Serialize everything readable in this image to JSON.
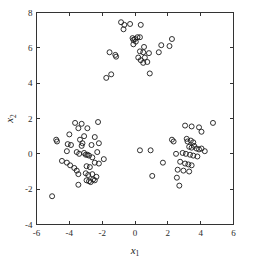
{
  "chart_data": {
    "type": "scatter",
    "title": "",
    "subtitle": "",
    "xlabel": "x_1",
    "xlabel_base": "x",
    "xlabel_sub": "1",
    "ylabel": "x_2",
    "ylabel_base": "x",
    "ylabel_sub": "2",
    "xlim": [
      -6,
      6
    ],
    "ylim": [
      -4,
      8
    ],
    "xticks": [
      -6,
      -4,
      -2,
      0,
      2,
      4,
      6
    ],
    "xtick_labels": [
      "-6",
      "-4",
      "-2",
      "0",
      "2",
      "4",
      "6"
    ],
    "yticks": [
      -4,
      -2,
      0,
      2,
      4,
      6,
      8
    ],
    "ytick_labels": [
      "-4",
      "-2",
      "0",
      "2",
      "4",
      "6",
      "8"
    ],
    "grid": false,
    "legend": null,
    "legend_position": "none",
    "marker": "open-circle",
    "marker_size": 5,
    "marker_color": "#1a1a1a",
    "series": [
      {
        "name": "cluster-top",
        "points": [
          [
            -0.85,
            7.45
          ],
          [
            -0.65,
            7.3
          ],
          [
            -0.7,
            7.05
          ],
          [
            -0.3,
            7.35
          ],
          [
            0.35,
            7.3
          ],
          [
            -0.15,
            6.55
          ],
          [
            -0.1,
            6.45
          ],
          [
            0.0,
            6.5
          ],
          [
            0.05,
            6.35
          ],
          [
            -0.1,
            6.2
          ],
          [
            0.15,
            6.6
          ],
          [
            0.3,
            6.6
          ],
          [
            0.55,
            6.05
          ],
          [
            2.25,
            6.5
          ],
          [
            1.6,
            6.15
          ],
          [
            -1.55,
            5.75
          ],
          [
            -1.2,
            5.6
          ],
          [
            -1.15,
            5.5
          ],
          [
            0.3,
            5.8
          ],
          [
            0.5,
            5.75
          ],
          [
            0.85,
            5.7
          ],
          [
            0.2,
            5.45
          ],
          [
            0.35,
            5.3
          ],
          [
            0.6,
            5.45
          ],
          [
            0.75,
            5.2
          ],
          [
            0.5,
            5.15
          ],
          [
            1.45,
            5.75
          ],
          [
            2.1,
            6.1
          ],
          [
            -1.75,
            4.3
          ],
          [
            -1.45,
            4.5
          ],
          [
            0.9,
            4.55
          ]
        ]
      },
      {
        "name": "cluster-left",
        "points": [
          [
            -3.65,
            1.75
          ],
          [
            -3.25,
            1.7
          ],
          [
            -2.9,
            1.45
          ],
          [
            -2.25,
            1.8
          ],
          [
            -4.0,
            1.1
          ],
          [
            -3.45,
            1.45
          ],
          [
            -3.1,
            1.0
          ],
          [
            -2.45,
            0.95
          ],
          [
            -4.8,
            0.8
          ],
          [
            -4.75,
            0.7
          ],
          [
            -4.1,
            0.55
          ],
          [
            -3.9,
            0.5
          ],
          [
            -3.35,
            0.8
          ],
          [
            -3.2,
            0.6
          ],
          [
            -3.25,
            0.45
          ],
          [
            -2.65,
            0.5
          ],
          [
            -2.2,
            0.6
          ],
          [
            -4.15,
            0.15
          ],
          [
            -3.55,
            0.1
          ],
          [
            -3.4,
            0.0
          ],
          [
            -3.1,
            0.05
          ],
          [
            -3.0,
            -0.05
          ],
          [
            -2.9,
            -0.05
          ],
          [
            -2.8,
            -0.1
          ],
          [
            -2.6,
            -0.2
          ],
          [
            -2.3,
            0.1
          ],
          [
            -1.9,
            -0.3
          ],
          [
            -4.45,
            -0.4
          ],
          [
            -4.15,
            -0.5
          ],
          [
            -3.95,
            -0.65
          ],
          [
            -3.7,
            -0.8
          ],
          [
            -3.55,
            -0.95
          ],
          [
            -2.95,
            -0.7
          ],
          [
            -2.75,
            -0.75
          ],
          [
            -2.45,
            -0.5
          ],
          [
            -2.2,
            -0.55
          ],
          [
            -3.45,
            -1.15
          ],
          [
            -3.0,
            -1.1
          ],
          [
            -2.85,
            -1.2
          ],
          [
            -2.6,
            -1.15
          ],
          [
            -2.95,
            -1.5
          ],
          [
            -2.8,
            -1.55
          ],
          [
            -2.7,
            -1.6
          ],
          [
            -2.55,
            -1.45
          ],
          [
            -2.45,
            -1.5
          ],
          [
            -3.45,
            -1.75
          ],
          [
            -5.05,
            -2.4
          ],
          [
            -2.35,
            -1.3
          ]
        ]
      },
      {
        "name": "cluster-right",
        "points": [
          [
            3.05,
            1.6
          ],
          [
            3.45,
            1.55
          ],
          [
            3.9,
            1.5
          ],
          [
            4.05,
            1.25
          ],
          [
            4.75,
            1.75
          ],
          [
            2.25,
            0.8
          ],
          [
            2.35,
            0.7
          ],
          [
            3.15,
            0.85
          ],
          [
            3.2,
            0.7
          ],
          [
            3.4,
            0.75
          ],
          [
            3.55,
            0.65
          ],
          [
            3.6,
            0.45
          ],
          [
            3.3,
            0.4
          ],
          [
            3.45,
            0.35
          ],
          [
            3.75,
            0.3
          ],
          [
            3.9,
            0.25
          ],
          [
            4.05,
            0.3
          ],
          [
            4.25,
            0.15
          ],
          [
            2.5,
            0.0
          ],
          [
            2.9,
            0.05
          ],
          [
            3.1,
            0.0
          ],
          [
            3.35,
            -0.05
          ],
          [
            3.55,
            -0.1
          ],
          [
            3.8,
            -0.15
          ],
          [
            2.75,
            -0.45
          ],
          [
            3.05,
            -0.55
          ],
          [
            3.25,
            -0.6
          ],
          [
            3.45,
            -0.65
          ],
          [
            1.7,
            -0.5
          ],
          [
            2.6,
            -0.9
          ],
          [
            2.95,
            -0.95
          ],
          [
            3.3,
            -1.0
          ],
          [
            2.55,
            -1.35
          ],
          [
            1.05,
            -1.25
          ],
          [
            2.7,
            -1.8
          ]
        ]
      },
      {
        "name": "midpoints",
        "points": [
          [
            0.3,
            0.2
          ],
          [
            0.95,
            0.2
          ]
        ]
      }
    ]
  }
}
